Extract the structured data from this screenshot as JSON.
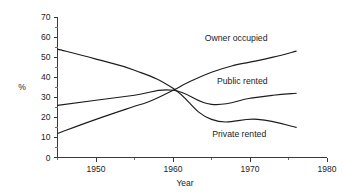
{
  "chart_data": {
    "type": "line",
    "title": "",
    "xlabel": "Year",
    "ylabel": "%",
    "xlim": [
      1945,
      1980
    ],
    "ylim": [
      0,
      70
    ],
    "grid": false,
    "legend_position": "inline-right",
    "x_ticks": [
      1950,
      1960,
      1970,
      1980
    ],
    "x_tick_labels": [
      "1950",
      "1960",
      "1970",
      "1980"
    ],
    "x_minor_step": 5,
    "y_ticks": [
      0,
      10,
      20,
      30,
      40,
      50,
      60,
      70
    ],
    "y_tick_labels": [
      "0",
      "10",
      "20",
      "30",
      "40",
      "50",
      "60",
      "70"
    ],
    "y_minor_step": 5,
    "series": [
      {
        "name": "Owner occupied",
        "color": "#1c1c1c",
        "x": [
          1945,
          1950,
          1955,
          1957,
          1960,
          1962,
          1965,
          1968,
          1970,
          1973,
          1976
        ],
        "values": [
          12,
          19,
          25.5,
          28,
          33.5,
          37.5,
          42.5,
          46,
          47.5,
          50,
          53
        ]
      },
      {
        "name": "Public rented",
        "color": "#1c1c1c",
        "x": [
          1945,
          1950,
          1955,
          1960,
          1965,
          1970,
          1973,
          1976
        ],
        "values": [
          26,
          28.5,
          31,
          33.5,
          26.5,
          29.5,
          31,
          32
        ]
      },
      {
        "name": "Private rented",
        "color": "#1c1c1c",
        "x": [
          1945,
          1950,
          1955,
          1960,
          1965,
          1971,
          1976
        ],
        "values": [
          54,
          49,
          43.5,
          34.5,
          19,
          19,
          15
        ]
      }
    ],
    "annotations": [
      {
        "text": "Owner occupied",
        "x": 1968.2,
        "y": 59.5
      },
      {
        "text": "Public rented",
        "x": 1969.0,
        "y": 38.0
      },
      {
        "text": "Private rented",
        "x": 1968.6,
        "y": 11.5
      }
    ]
  }
}
